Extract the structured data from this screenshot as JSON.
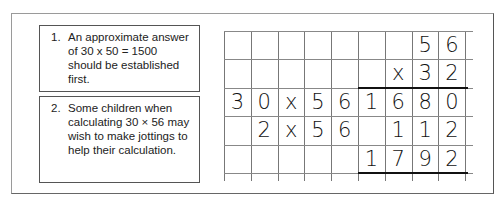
{
  "notes": [
    {
      "number": "1.",
      "text": "An approximate answer of 30 x 50 = 1500 should be established first."
    },
    {
      "number": "2.",
      "text": "Some children when calculating 30 × 56 may wish to make jottings to help their calculation."
    }
  ],
  "grid": {
    "columns": 9,
    "rows": 5,
    "cells": [
      [
        "",
        "",
        "",
        "",
        "",
        "",
        "",
        "5",
        "6"
      ],
      [
        "",
        "",
        "",
        "",
        "",
        "",
        "x",
        "3",
        "2"
      ],
      [
        "3",
        "0",
        "x",
        "5",
        "6",
        "1",
        "6",
        "8",
        "0"
      ],
      [
        "",
        "2",
        "x",
        "5",
        "6",
        "",
        "1",
        "1",
        "2"
      ],
      [
        "",
        "",
        "",
        "",
        "",
        "1",
        "7",
        "9",
        "2"
      ]
    ]
  }
}
